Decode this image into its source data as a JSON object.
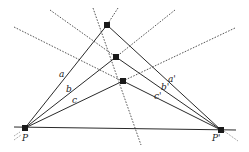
{
  "diagram": {
    "title": "",
    "points": {
      "P": {
        "x": 25,
        "y": 128,
        "label": "P"
      },
      "P_prime": {
        "x": 221,
        "y": 130,
        "label": "P'"
      },
      "A": {
        "x": 107,
        "y": 25
      },
      "B": {
        "x": 116,
        "y": 57
      },
      "C": {
        "x": 123,
        "y": 81
      }
    },
    "labels": {
      "a": "a",
      "b": "b",
      "c": "c",
      "a_prime": "a'",
      "b_prime": "b'",
      "c_prime": "c'",
      "P": "P",
      "P_prime": "P'"
    },
    "colors": {
      "line": "#2a2a2a",
      "dashed": "#444444",
      "point": "#1a1a1a"
    }
  }
}
